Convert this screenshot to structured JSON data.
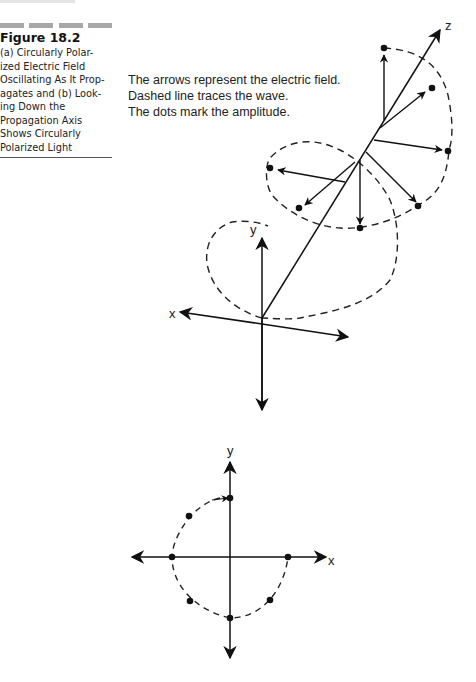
{
  "figure": {
    "number": "Figure 18.2",
    "caption_lines": [
      "(a) Circularly Polar-",
      "ized Electric Field",
      "Oscillating As It Prop-",
      "agates and (b) Look-",
      "ing Down the",
      "Propagation Axis",
      "Shows Circularly",
      "Polarized Light"
    ]
  },
  "annotation": {
    "lines": [
      "The arrows represent the electric field.",
      "Dashed line traces the wave.",
      "The dots mark the amplitude."
    ]
  },
  "diagram_a": {
    "axes": {
      "x": "x",
      "y": "y",
      "z": "z"
    },
    "description": "3D view: electric field vectors rotating around the z propagation axis, tracing a dashed helix"
  },
  "diagram_b": {
    "axes": {
      "x": "x",
      "y": "y"
    },
    "description": "View down the propagation axis: dots on a dashed circle showing circular polarization"
  }
}
